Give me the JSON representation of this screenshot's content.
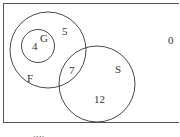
{
  "diagram": {
    "type": "venn",
    "universe": {
      "outside_value": "0"
    },
    "sets": [
      {
        "name": "F",
        "label": "F"
      },
      {
        "name": "G",
        "label": "G"
      },
      {
        "name": "S",
        "label": "S"
      }
    ],
    "regions": {
      "G_only": "4",
      "F_not_G_not_S": "5",
      "F_and_S": "7",
      "S_only": "12",
      "outside": "0"
    },
    "caption": "(ii)"
  },
  "colors": {
    "stroke": "#333333",
    "background": "#ffffff"
  }
}
